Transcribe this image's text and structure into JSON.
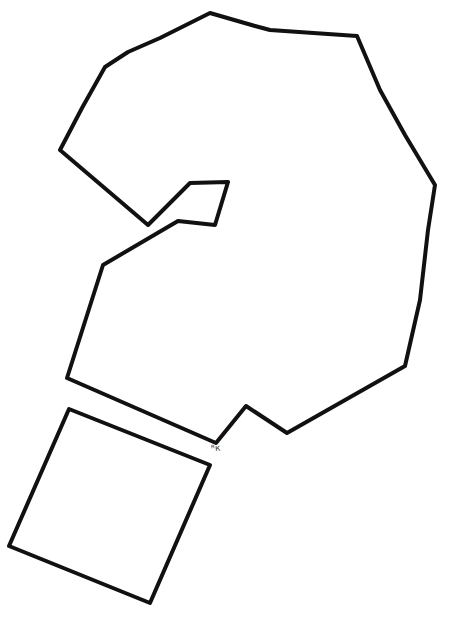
{
  "drawing": {
    "background": "#ffffff",
    "stroke_color": "#111111",
    "shapes": [
      {
        "name": "large-irregular-polygon",
        "points": "60,150 82,108 105,67 128,52 160,38 210,13 255,26 270,30 357,36 380,90 405,135 435,185 428,230 420,300 405,366 287,433 246,406 216,443 67,378 103,265 178,221 215,225 228,182 190,183 148,225"
      },
      {
        "name": "quadrilateral",
        "points": "69,409 210,465 150,603 9,546"
      }
    ],
    "annotation": {
      "text": "ᴿк",
      "x": 212,
      "y": 446
    }
  }
}
